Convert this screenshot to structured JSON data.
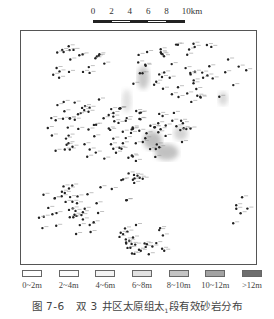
{
  "scale_bar": {
    "ticks": [
      "0",
      "2",
      "4",
      "6",
      "8",
      "10km"
    ],
    "unit": "km",
    "segments": [
      "#222222",
      "#ffffff",
      "#222222",
      "#ffffff",
      "#222222"
    ]
  },
  "map": {
    "description": "双3井区太原组太1段有效砂岩厚度分布图",
    "frame_color": "#555555",
    "well_color": "#222222",
    "well_clusters": [
      {
        "name": "northwest",
        "cx": 0.22,
        "cy": 0.14,
        "rx": 0.14,
        "ry": 0.08,
        "n": 22
      },
      {
        "name": "west-central",
        "cx": 0.28,
        "cy": 0.42,
        "rx": 0.2,
        "ry": 0.14,
        "n": 60
      },
      {
        "name": "northeast",
        "cx": 0.7,
        "cy": 0.18,
        "rx": 0.26,
        "ry": 0.13,
        "n": 55
      },
      {
        "name": "center",
        "cx": 0.55,
        "cy": 0.45,
        "rx": 0.18,
        "ry": 0.12,
        "n": 45
      },
      {
        "name": "southwest",
        "cx": 0.2,
        "cy": 0.78,
        "rx": 0.14,
        "ry": 0.12,
        "n": 40
      },
      {
        "name": "south-central",
        "cx": 0.45,
        "cy": 0.67,
        "rx": 0.12,
        "ry": 0.06,
        "n": 14
      },
      {
        "name": "southeast",
        "cx": 0.52,
        "cy": 0.9,
        "rx": 0.12,
        "ry": 0.08,
        "n": 30
      },
      {
        "name": "east-edge",
        "cx": 0.94,
        "cy": 0.82,
        "rx": 0.04,
        "ry": 0.12,
        "n": 6
      }
    ],
    "thickness_patches": [
      {
        "cx": 0.52,
        "cy": 0.2,
        "rx": 0.025,
        "ry": 0.05,
        "color": "#9a9a9a"
      },
      {
        "cx": 0.56,
        "cy": 0.47,
        "rx": 0.04,
        "ry": 0.04,
        "color": "#8a8a8a"
      },
      {
        "cx": 0.62,
        "cy": 0.52,
        "rx": 0.05,
        "ry": 0.035,
        "color": "#909090"
      },
      {
        "cx": 0.68,
        "cy": 0.44,
        "rx": 0.03,
        "ry": 0.03,
        "color": "#b0b0b0"
      },
      {
        "cx": 0.86,
        "cy": 0.29,
        "rx": 0.02,
        "ry": 0.03,
        "color": "#b8b8b8"
      },
      {
        "cx": 0.45,
        "cy": 0.3,
        "rx": 0.02,
        "ry": 0.05,
        "color": "#c8c8c8"
      }
    ]
  },
  "legend": [
    {
      "label": "0~2m",
      "color": "#ffffff"
    },
    {
      "label": "2~4m",
      "color": "#fbfbfb"
    },
    {
      "label": "4~6m",
      "color": "#f4f4f4"
    },
    {
      "label": "6~8m",
      "color": "#e2e2e2"
    },
    {
      "label": "8~10m",
      "color": "#c4c4c4"
    },
    {
      "label": "10~12m",
      "color": "#a2a2a2"
    },
    {
      "label": ">12m",
      "color": "#6e6e6e"
    }
  ],
  "caption": {
    "figure_number": "图 7-6",
    "title_prefix": "双 3 井区太原组太",
    "subscript": "1",
    "title_suffix": "段有效砂岩分布"
  }
}
